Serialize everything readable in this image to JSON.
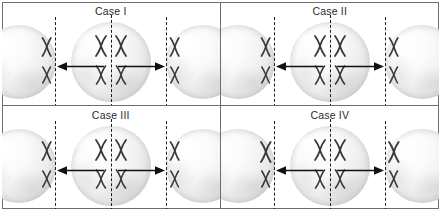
{
  "figure": {
    "type": "biology-diagram",
    "layout": "2x2 grid of panels, each panel shows a central parent cell with a dashed division plate and two daughter cells to the left and right connected by arrows",
    "colors": {
      "frame": "#6e6e6e",
      "background": "#ffffff",
      "chromosome": "#3a3a3a",
      "dashed_line": "#1c1c1c",
      "arrow": "#111111",
      "text": "#2b2b2b",
      "cell_fill": "#f0f0f0"
    }
  },
  "panels": [
    {
      "id": "case-1",
      "label": "Case I",
      "position": "top-left",
      "center_cell": {
        "name": "parent-cell",
        "chromosome_rows": [
          {
            "shapes": [
              "X",
              "X"
            ],
            "description": "pair of duplicated chromosomes aligned on the plate"
          },
          {
            "shapes": [
              "X",
              "X"
            ],
            "description": "second pair of duplicated chromosomes aligned on the plate"
          }
        ]
      },
      "left_daughter_cell": {
        "name": "left-daughter-cell",
        "chromosome_rows": [
          {
            "shapes": [
              "X"
            ]
          },
          {
            "shapes": [
              "X"
            ]
          }
        ]
      },
      "right_daughter_cell": {
        "name": "right-daughter-cell",
        "chromosome_rows": [
          {
            "shapes": [
              "X"
            ]
          },
          {
            "shapes": [
              "X"
            ]
          }
        ]
      },
      "arrows": {
        "left": "left-arrow",
        "right": "right-arrow"
      }
    },
    {
      "id": "case-2",
      "label": "Case II",
      "position": "top-right",
      "center_cell": {
        "name": "parent-cell",
        "chromosome_rows": [
          {
            "shapes": [
              "X",
              "X"
            ]
          },
          {
            "shapes": [
              "X",
              "X"
            ]
          }
        ]
      },
      "left_daughter_cell": {
        "name": "left-daughter-cell",
        "chromosome_rows": [
          {
            "shapes": [
              "X"
            ]
          },
          {
            "shapes": [
              "X"
            ]
          }
        ]
      },
      "right_daughter_cell": {
        "name": "right-daughter-cell",
        "chromosome_rows": [
          {
            "shapes": [
              "X"
            ]
          },
          {
            "shapes": [
              "X"
            ]
          }
        ]
      },
      "arrows": {
        "left": "left-arrow",
        "right": "right-arrow"
      }
    },
    {
      "id": "case-3",
      "label": "Case III",
      "position": "bottom-left",
      "center_cell": {
        "name": "parent-cell",
        "chromosome_rows": [
          {
            "shapes": [
              "X",
              "X"
            ]
          },
          {
            "shapes": [
              "X",
              "X"
            ]
          }
        ]
      },
      "left_daughter_cell": {
        "name": "left-daughter-cell",
        "chromosome_rows": [
          {
            "shapes": [
              "X"
            ]
          },
          {
            "shapes": [
              "X"
            ]
          }
        ]
      },
      "right_daughter_cell": {
        "name": "right-daughter-cell",
        "chromosome_rows": [
          {
            "shapes": [
              "X"
            ]
          },
          {
            "shapes": [
              "X"
            ]
          }
        ]
      },
      "arrows": {
        "left": "left-arrow",
        "right": "right-arrow"
      }
    },
    {
      "id": "case-4",
      "label": "Case IV",
      "position": "bottom-right",
      "center_cell": {
        "name": "parent-cell",
        "chromosome_rows": [
          {
            "shapes": [
              "X",
              "X"
            ]
          },
          {
            "shapes": [
              "X",
              "X"
            ]
          }
        ]
      },
      "left_daughter_cell": {
        "name": "left-daughter-cell",
        "chromosome_rows": [
          {
            "shapes": [
              "X"
            ]
          },
          {
            "shapes": [
              "X"
            ]
          }
        ]
      },
      "right_daughter_cell": {
        "name": "right-daughter-cell",
        "chromosome_rows": [
          {
            "shapes": [
              "X"
            ]
          },
          {
            "shapes": [
              "X"
            ]
          }
        ]
      },
      "arrows": {
        "left": "left-arrow",
        "right": "right-arrow"
      }
    }
  ]
}
